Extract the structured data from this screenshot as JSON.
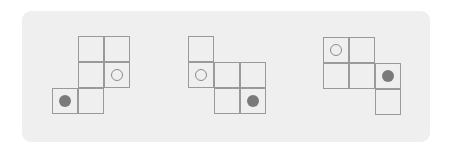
{
  "diagram": {
    "cell_size": 26,
    "colors": {
      "panel_bg": "#efefef",
      "line": "#9a9a9a",
      "filled_dot": "#7a7a7a",
      "hollow_dot_stroke": "#8a8a8a"
    },
    "figures": [
      {
        "id": "figure-1",
        "origin": [
          52,
          36
        ],
        "cells": [
          {
            "col": 1,
            "row": 0
          },
          {
            "col": 2,
            "row": 0
          },
          {
            "col": 1,
            "row": 1
          },
          {
            "col": 2,
            "row": 1,
            "marker": "hollow"
          },
          {
            "col": 0,
            "row": 2,
            "marker": "filled"
          },
          {
            "col": 1,
            "row": 2
          }
        ]
      },
      {
        "id": "figure-2",
        "origin": [
          188,
          36
        ],
        "cells": [
          {
            "col": 0,
            "row": 0
          },
          {
            "col": 0,
            "row": 1,
            "marker": "hollow"
          },
          {
            "col": 1,
            "row": 1
          },
          {
            "col": 2,
            "row": 1
          },
          {
            "col": 1,
            "row": 2
          },
          {
            "col": 2,
            "row": 2,
            "marker": "filled"
          }
        ]
      },
      {
        "id": "figure-3",
        "origin": [
          323,
          37
        ],
        "cells": [
          {
            "col": 0,
            "row": 0,
            "marker": "hollow"
          },
          {
            "col": 1,
            "row": 0
          },
          {
            "col": 0,
            "row": 1
          },
          {
            "col": 1,
            "row": 1
          },
          {
            "col": 2,
            "row": 1,
            "marker": "filled"
          },
          {
            "col": 2,
            "row": 2
          }
        ]
      }
    ]
  }
}
